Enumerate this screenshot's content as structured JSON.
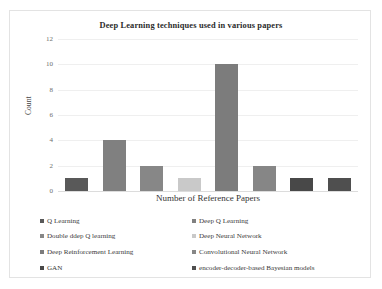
{
  "chart_data": {
    "type": "bar",
    "title": "Deep Learning techniques used in various papers",
    "xlabel": "Number of Reference Papers",
    "ylabel": "Count",
    "ylim": [
      0,
      12
    ],
    "yticks": [
      12,
      10,
      8,
      6,
      4,
      2,
      0
    ],
    "grid": true,
    "legend_position": "bottom",
    "categories": [
      "Q Learning",
      "Deep Q Learning",
      "Double ddep Q learning",
      "Deep Neural Network",
      "Deep Reinforcement Learning",
      "Convolutional Neural Network",
      "GAN",
      "encoder-decoder-based Bayesian models"
    ],
    "values": [
      1,
      4,
      2,
      1,
      10,
      2,
      1,
      1
    ],
    "colors": [
      "#595959",
      "#808080",
      "#878787",
      "#c9c9c9",
      "#7c7c7c",
      "#868686",
      "#484848",
      "#4f4f4f"
    ]
  },
  "legend": {
    "rows": [
      {
        "left": {
          "label": "Q Learning",
          "color": "#595959"
        },
        "right": {
          "label": "Deep Q Learning",
          "color": "#808080"
        }
      },
      {
        "left": {
          "label": "Double ddep Q learning",
          "color": "#878787"
        },
        "right": {
          "label": "Deep Neural Network",
          "color": "#c9c9c9"
        }
      },
      {
        "left": {
          "label": "Deep Reinforcement Learning",
          "color": "#7c7c7c"
        },
        "right": {
          "label": "Convolutional Neural Network",
          "color": "#868686"
        }
      },
      {
        "left": {
          "label": "GAN",
          "color": "#484848"
        },
        "right": {
          "label": "encoder-decoder-based Bayesian models",
          "color": "#4f4f4f"
        }
      }
    ]
  }
}
